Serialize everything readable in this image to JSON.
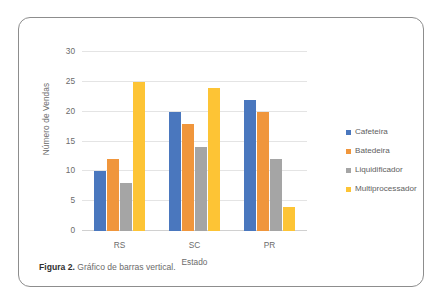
{
  "figure": {
    "caption_label": "Figura 2.",
    "caption_text": "Gráfico de barras vertical."
  },
  "chart_data": {
    "type": "bar",
    "title": "",
    "subtitle": "",
    "xlabel": "Estado",
    "ylabel": "Número de Vendas",
    "categories": [
      "RS",
      "SC",
      "PR"
    ],
    "series": [
      {
        "name": "Cafeteira",
        "color": "#4A77BE",
        "values": [
          10,
          20,
          22
        ]
      },
      {
        "name": "Batedeira",
        "color": "#F0963C",
        "values": [
          12,
          18,
          20
        ]
      },
      {
        "name": "Liquidificador",
        "color": "#A5A5A5",
        "values": [
          8,
          14,
          12
        ]
      },
      {
        "name": "Multiprocessador",
        "color": "#FDC435",
        "values": [
          25,
          24,
          4
        ]
      }
    ],
    "ylim": [
      0,
      30
    ],
    "ytick_step": 5,
    "yticks": [
      0,
      5,
      10,
      15,
      20,
      25,
      30
    ],
    "ytick_labels": [
      "0",
      "5",
      "10",
      "15",
      "20",
      "25",
      "30"
    ],
    "grid": true,
    "grid_axis": "y",
    "legend": true,
    "legend_position": "right",
    "legend_entries": [
      "Cafeteira",
      "Batedeira",
      "Liquidificador",
      "Multiprocessador"
    ]
  }
}
